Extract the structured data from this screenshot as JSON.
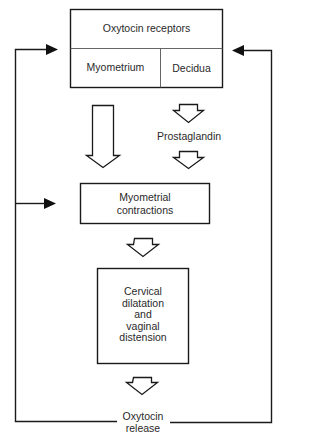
{
  "diagram": {
    "nodes": {
      "oxytocin_receptors": {
        "title": "Oxytocin receptors",
        "cells": [
          "Myometrium",
          "Decidua"
        ]
      },
      "prostaglandin": {
        "label": "Prostaglandin"
      },
      "myometrial_contractions": {
        "line1": "Myometrial",
        "line2": "contractions"
      },
      "cervical_dilatation": {
        "lines": [
          "Cervical",
          "dilatation",
          "and",
          "vaginal",
          "distension"
        ]
      },
      "oxytocin_release": {
        "line1": "Oxytocin",
        "line2": "release"
      }
    },
    "edges": [
      {
        "from": "Myometrium",
        "to": "Myometrial contractions",
        "style": "long hollow arrow"
      },
      {
        "from": "Decidua",
        "to": "Prostaglandin",
        "style": "hollow arrow"
      },
      {
        "from": "Prostaglandin",
        "to": "Myometrial contractions",
        "style": "hollow arrow"
      },
      {
        "from": "Myometrial contractions",
        "to": "Cervical dilatation and vaginal distension",
        "style": "hollow arrow"
      },
      {
        "from": "Cervical dilatation and vaginal distension",
        "to": "Oxytocin release",
        "style": "hollow arrow"
      },
      {
        "from": "Oxytocin release",
        "to": "Oxytocin receptors (left)",
        "style": "feedback line, solid arrowhead"
      },
      {
        "from": "Oxytocin release",
        "to": "Myometrial contractions",
        "style": "feedback line, solid arrowhead"
      },
      {
        "from": "Oxytocin release",
        "to": "Oxytocin receptors (right)",
        "style": "feedback line, solid arrowhead"
      }
    ],
    "colors": {
      "stroke": "#1a1a1a",
      "text": "#2a2a2a",
      "background": "#ffffff"
    }
  }
}
